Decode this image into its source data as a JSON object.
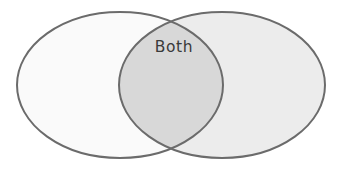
{
  "canvas": {
    "width": 343,
    "height": 170,
    "background_color": "#ffffff"
  },
  "diagram": {
    "type": "venn",
    "set_count": 2,
    "stroke_color": "#6b6b6b",
    "stroke_width": 2,
    "regions": [
      {
        "id": "left-only",
        "name": "left-circle",
        "fill_color": "#fafafa",
        "label": "",
        "center_x": 120,
        "center_y": 85,
        "radius_x": 103,
        "radius_y": 73
      },
      {
        "id": "right-only",
        "name": "right-circle",
        "fill_color": "#ececec",
        "label": "",
        "center_x": 222,
        "center_y": 85,
        "radius_x": 103,
        "radius_y": 73
      },
      {
        "id": "intersection",
        "name": "overlap-region",
        "fill_color": "#d8d8d8",
        "label": "Both",
        "label_x": 174,
        "label_y": 52,
        "label_color": "#3a3a3a"
      }
    ]
  },
  "labels": {
    "intersection": "Both",
    "left": "",
    "right": ""
  }
}
